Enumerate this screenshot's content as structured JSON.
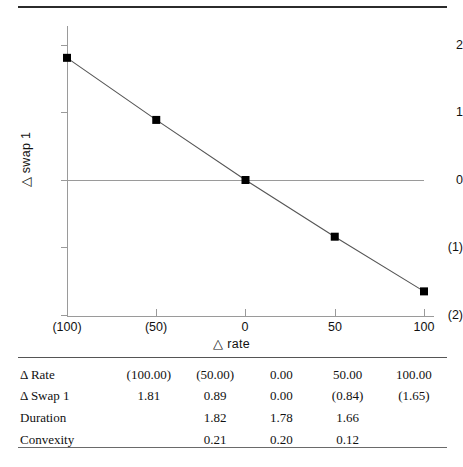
{
  "chart_data": {
    "type": "line",
    "title": "",
    "xlabel": "△ rate",
    "ylabel": "△ swap 1",
    "x": [
      -100,
      -50,
      0,
      50,
      100
    ],
    "y": [
      1.81,
      0.89,
      0.0,
      -0.84,
      -1.65
    ],
    "series": [
      {
        "name": "△ swap 1",
        "values": [
          1.81,
          0.89,
          0.0,
          -0.84,
          -1.65
        ],
        "marker": "square",
        "marker_color": "#000000",
        "line_color": "#555555"
      }
    ],
    "xlim": [
      -100,
      115
    ],
    "ylim": [
      -2,
      2.3
    ],
    "xticks": [
      -100,
      -50,
      0,
      50,
      100
    ],
    "xticklabels": [
      "(100)",
      "(50)",
      "0",
      "50",
      "100"
    ],
    "yticks": [
      2,
      1,
      0,
      -1,
      -2
    ],
    "yticklabels": [
      "2",
      "1",
      "0",
      "(1)",
      "(2)"
    ],
    "grid": false,
    "legend": "none",
    "zero_line": true
  },
  "axis": {
    "y_title": "△ swap 1",
    "x_title": "△ rate",
    "y_ticks": [
      {
        "label": "2",
        "value": 2
      },
      {
        "label": "1",
        "value": 1
      },
      {
        "label": "0",
        "value": 0
      },
      {
        "label": "(1)",
        "value": -1
      },
      {
        "label": "(2)",
        "value": -2
      }
    ],
    "x_ticks": [
      {
        "label": "(100)",
        "value": -100
      },
      {
        "label": "(50)",
        "value": -50
      },
      {
        "label": "0",
        "value": 0
      },
      {
        "label": "50",
        "value": 50
      },
      {
        "label": "100",
        "value": 100
      }
    ]
  },
  "table": {
    "rows": [
      {
        "label": "Δ Rate",
        "values": [
          "(100.00)",
          "(50.00)",
          "0.00",
          "50.00",
          "100.00"
        ]
      },
      {
        "label": "Δ Swap 1",
        "values": [
          "1.81",
          "0.89",
          "0.00",
          "(0.84)",
          "(1.65)"
        ]
      },
      {
        "label": "Duration",
        "values": [
          "",
          "1.82",
          "1.78",
          "1.66",
          ""
        ]
      },
      {
        "label": "Convexity",
        "values": [
          "",
          "0.21",
          "0.20",
          "0.12",
          ""
        ]
      }
    ]
  },
  "colors": {
    "line": "#555555",
    "marker": "#000000",
    "axis": "#9a9a9a",
    "rule": "#2b2b2b",
    "text": "#111111"
  }
}
